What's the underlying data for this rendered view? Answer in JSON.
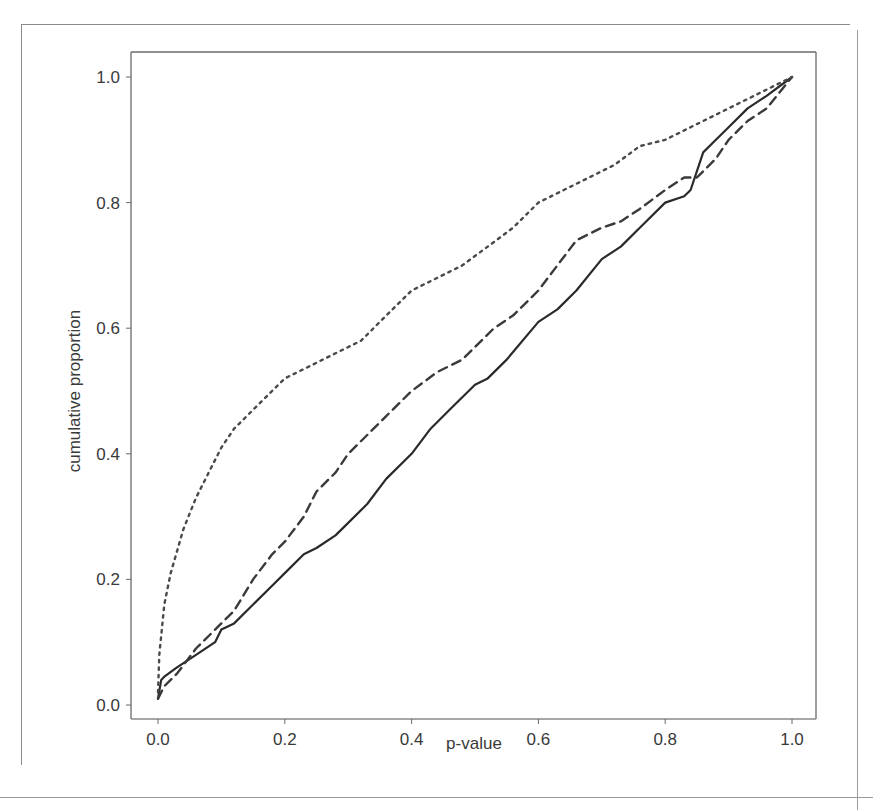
{
  "chart_data": {
    "type": "line",
    "title": "",
    "xlabel": "p-value",
    "ylabel": "cumulative proportion",
    "xlim": [
      0.0,
      1.0
    ],
    "ylim": [
      0.0,
      1.0
    ],
    "xticks": [
      "0.0",
      "0.2",
      "0.4",
      "0.6",
      "0.8",
      "1.0"
    ],
    "yticks": [
      "0.0",
      "0.2",
      "0.4",
      "0.6",
      "0.8",
      "1.0"
    ],
    "grid": false,
    "legend": null,
    "series": [
      {
        "name": "solid",
        "style": "solid",
        "x": [
          0.0,
          0.005,
          0.01,
          0.03,
          0.06,
          0.09,
          0.1,
          0.12,
          0.15,
          0.18,
          0.2,
          0.23,
          0.25,
          0.28,
          0.3,
          0.33,
          0.36,
          0.4,
          0.43,
          0.46,
          0.5,
          0.52,
          0.55,
          0.6,
          0.63,
          0.66,
          0.7,
          0.73,
          0.76,
          0.8,
          0.83,
          0.84,
          0.86,
          0.88,
          0.9,
          0.93,
          0.96,
          1.0
        ],
        "y": [
          0.01,
          0.04,
          0.045,
          0.06,
          0.08,
          0.1,
          0.12,
          0.13,
          0.16,
          0.19,
          0.21,
          0.24,
          0.25,
          0.27,
          0.29,
          0.32,
          0.36,
          0.4,
          0.44,
          0.47,
          0.51,
          0.52,
          0.55,
          0.61,
          0.63,
          0.66,
          0.71,
          0.73,
          0.76,
          0.8,
          0.81,
          0.82,
          0.88,
          0.9,
          0.92,
          0.95,
          0.97,
          1.0
        ]
      },
      {
        "name": "dashed",
        "style": "dashed",
        "x": [
          0.0,
          0.01,
          0.03,
          0.06,
          0.09,
          0.12,
          0.15,
          0.18,
          0.2,
          0.23,
          0.25,
          0.28,
          0.3,
          0.33,
          0.36,
          0.4,
          0.44,
          0.48,
          0.5,
          0.53,
          0.56,
          0.6,
          0.63,
          0.66,
          0.7,
          0.73,
          0.76,
          0.8,
          0.83,
          0.85,
          0.88,
          0.9,
          0.93,
          0.96,
          1.0
        ],
        "y": [
          0.01,
          0.03,
          0.05,
          0.09,
          0.12,
          0.15,
          0.2,
          0.24,
          0.26,
          0.3,
          0.34,
          0.37,
          0.4,
          0.43,
          0.46,
          0.5,
          0.53,
          0.55,
          0.57,
          0.6,
          0.62,
          0.66,
          0.7,
          0.74,
          0.76,
          0.77,
          0.79,
          0.82,
          0.84,
          0.84,
          0.87,
          0.9,
          0.93,
          0.95,
          1.0
        ]
      },
      {
        "name": "dotted",
        "style": "dotted",
        "x": [
          0.0,
          0.002,
          0.01,
          0.02,
          0.04,
          0.06,
          0.08,
          0.1,
          0.12,
          0.15,
          0.18,
          0.2,
          0.24,
          0.28,
          0.32,
          0.36,
          0.4,
          0.44,
          0.48,
          0.52,
          0.56,
          0.6,
          0.64,
          0.68,
          0.72,
          0.76,
          0.8,
          0.84,
          0.88,
          0.92,
          0.96,
          1.0
        ],
        "y": [
          0.02,
          0.08,
          0.16,
          0.21,
          0.28,
          0.33,
          0.37,
          0.41,
          0.44,
          0.47,
          0.5,
          0.52,
          0.54,
          0.56,
          0.58,
          0.62,
          0.66,
          0.68,
          0.7,
          0.73,
          0.76,
          0.8,
          0.82,
          0.84,
          0.86,
          0.89,
          0.9,
          0.92,
          0.94,
          0.96,
          0.98,
          1.0
        ]
      }
    ]
  }
}
